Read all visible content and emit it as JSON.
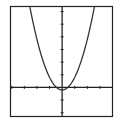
{
  "chart_data": {
    "type": "line",
    "title": "",
    "xlabel": "",
    "ylabel": "",
    "function": "y = x^2 - 0.2",
    "xlim": [
      -4.1,
      4.0
    ],
    "ylim": [
      -2.3,
      6.4
    ],
    "x_tick_step": 1,
    "y_tick_step": 1,
    "x_ticks": [
      -4,
      -3,
      -2,
      -1,
      1,
      2,
      3,
      4
    ],
    "y_ticks": [
      -2,
      -1,
      1,
      2,
      3,
      4,
      5,
      6
    ],
    "grid": false,
    "legend": null,
    "series": [
      {
        "name": "parabola",
        "x": [
          -2.5,
          -2.0,
          -1.5,
          -1.0,
          -0.5,
          0.0,
          0.5,
          1.0,
          1.5,
          2.0,
          2.5
        ],
        "values": [
          6.05,
          3.8,
          2.05,
          0.8,
          0.05,
          -0.2,
          0.05,
          0.8,
          2.05,
          3.8,
          6.05
        ]
      }
    ]
  },
  "style": {
    "frame_color": "#222222",
    "axis_color": "#222222",
    "curve_color": "#333333",
    "background": "#ffffff"
  }
}
